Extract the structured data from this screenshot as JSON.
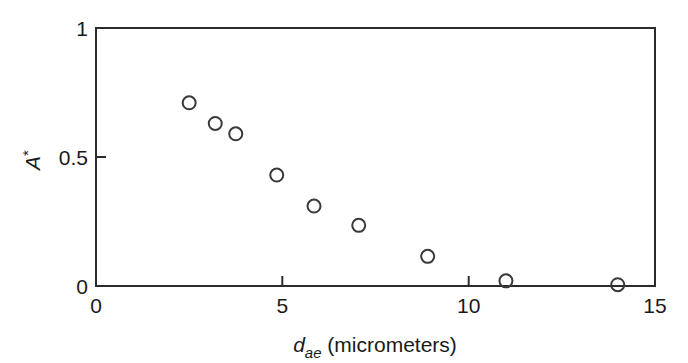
{
  "chart_data": {
    "type": "scatter",
    "title": "",
    "xlabel": "d_ae (micrometers)",
    "xlabel_parts": {
      "symbol": "d",
      "subscript": "ae",
      "unit_text": " (micrometers)"
    },
    "ylabel": "A*",
    "ylabel_parts": {
      "symbol": "A",
      "superscript": "*"
    },
    "xlim": [
      0,
      15
    ],
    "ylim": [
      0,
      1
    ],
    "xticks": [
      0,
      5,
      10,
      15
    ],
    "xticklabels": [
      "0",
      "5",
      "10",
      "15"
    ],
    "yticks": [
      0,
      0.5,
      1
    ],
    "yticklabels": [
      "0",
      "0.5",
      "1"
    ],
    "grid": false,
    "legend": null,
    "marker": "open-circle",
    "marker_color": "#3a3a3a",
    "marker_size_px": 13,
    "points": [
      {
        "x": 2.5,
        "y": 0.71
      },
      {
        "x": 3.2,
        "y": 0.63
      },
      {
        "x": 3.75,
        "y": 0.59
      },
      {
        "x": 4.85,
        "y": 0.43
      },
      {
        "x": 5.85,
        "y": 0.31
      },
      {
        "x": 7.05,
        "y": 0.235
      },
      {
        "x": 8.9,
        "y": 0.115
      },
      {
        "x": 11.0,
        "y": 0.02
      },
      {
        "x": 14.0,
        "y": 0.005
      }
    ],
    "x": [
      2.5,
      3.2,
      3.75,
      4.85,
      5.85,
      7.05,
      8.9,
      11.0,
      14.0
    ],
    "values": [
      0.71,
      0.63,
      0.59,
      0.43,
      0.31,
      0.235,
      0.115,
      0.02,
      0.005
    ],
    "axis_color": "#2b2b2b",
    "background_color": "#ffffff",
    "spines": [
      "left",
      "top",
      "right",
      "bottom"
    ]
  }
}
